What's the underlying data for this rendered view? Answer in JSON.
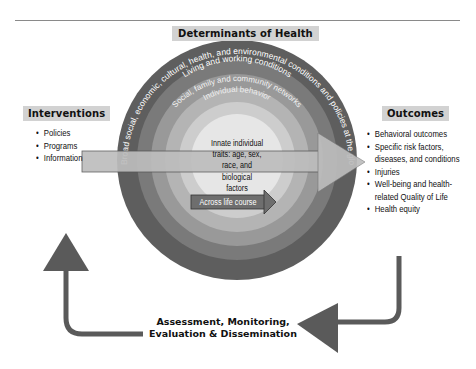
{
  "title": "Determinants of Health",
  "interventions": {
    "heading": "Interventions",
    "items": [
      "Policies",
      "Programs",
      "Information"
    ]
  },
  "outcomes": {
    "heading": "Outcomes",
    "items": [
      "Behavioral outcomes",
      "Specific risk factors,",
      "diseases, and conditions",
      "Injuries",
      "Well-being and health-",
      "related Quality of Life",
      "Health equity"
    ]
  },
  "rings": {
    "outer": "Broad social, economic, cultural, health, and environmental conditions and policies at the global, national, state, and local levels",
    "living": "Living and working conditions",
    "social": "Social, family and community networks",
    "individual": "Individual behavior",
    "core": [
      "Innate individual",
      "traits: age, sex,",
      "race, and",
      "biological",
      "factors"
    ]
  },
  "life_course_label": "Across life course",
  "cycle_label": [
    "Assessment, Monitoring,",
    "Evaluation & Dissemination"
  ],
  "colors": {
    "ring_outer": "#5e5e5e",
    "ring_2": "#7a7a7a",
    "ring_3": "#999999",
    "ring_4": "#b4b4b4",
    "ring_5": "#cdcdcd",
    "core": "#e6e6e6",
    "main_arrow": "#bdbdbd",
    "life_arrow": "#6e6e6e",
    "cycle_arrow": "#5a5a5a",
    "header_bg": "#d2d2d2"
  }
}
